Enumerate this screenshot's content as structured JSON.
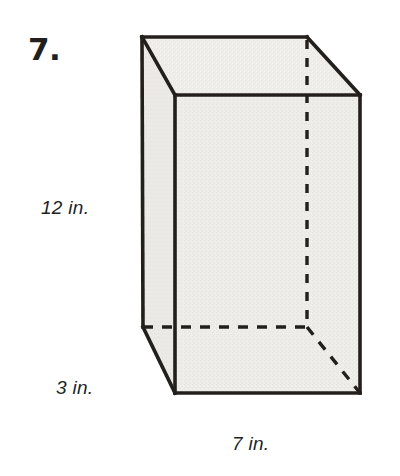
{
  "problem": {
    "number_label": "7.",
    "figure_type": "rectangular-prism"
  },
  "dimensions": {
    "height": "12 in.",
    "depth": "3 in.",
    "width": "7 in."
  },
  "colors": {
    "background": "#ffffff",
    "face_fill": "#eeedea",
    "edge_stroke": "#231f1c",
    "text": "#231f1c"
  },
  "figure": {
    "front_face_name": "front-face",
    "top_face_name": "top-face",
    "left_face_name": "left-face",
    "hidden_edges_name": "hidden-edges"
  }
}
